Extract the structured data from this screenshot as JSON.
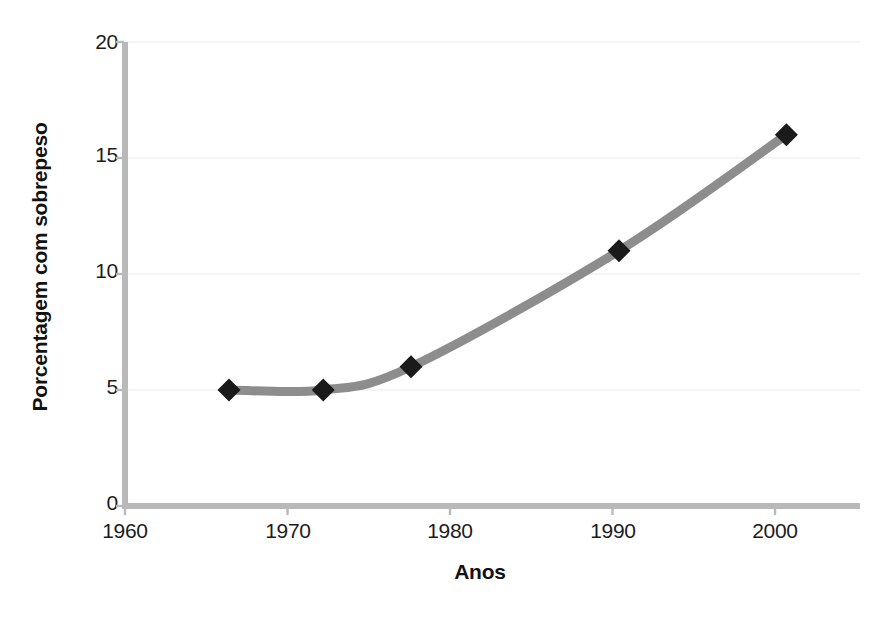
{
  "chart_data": {
    "type": "line",
    "title": "",
    "xlabel": "Anos",
    "ylabel": "Porcentagem com sobrepeso",
    "xlim": [
      1960,
      2004
    ],
    "ylim": [
      0,
      20
    ],
    "xticks": [
      1960,
      1970,
      1980,
      1990,
      2000
    ],
    "xtick_labels": [
      "1960",
      "1970",
      "1980",
      "1990",
      "2000"
    ],
    "yticks": [
      0,
      5,
      10,
      15,
      20
    ],
    "ytick_labels": [
      "0",
      "5",
      "10",
      "15",
      "20"
    ],
    "grid": true,
    "grid_axis": "y",
    "legend": false,
    "marker": "diamond",
    "marker_color": "#1a1a1a",
    "line_color": "#8d8d8d",
    "line_width_px": 9,
    "axis_color": "#b9b9b9",
    "series": [
      {
        "name": "Porcentagem com sobrepeso",
        "x": [
          1966.4,
          1972.2,
          1977.6,
          1990.4,
          2000.7
        ],
        "values": [
          5,
          5,
          6,
          11,
          16
        ],
        "points": [
          {
            "x": 1966.4,
            "y": 5
          },
          {
            "x": 1972.2,
            "y": 5
          },
          {
            "x": 1977.6,
            "y": 6
          },
          {
            "x": 1990.4,
            "y": 11
          },
          {
            "x": 2000.7,
            "y": 16
          }
        ]
      }
    ]
  },
  "axes": {
    "y_title": "Porcentagem com sobrepeso",
    "x_title": "Anos",
    "y_labels": {
      "t20": "20",
      "t15": "15",
      "t10": "10",
      "t5": "5",
      "t0": "0"
    },
    "x_labels": {
      "t1960": "1960",
      "t1970": "1970",
      "t1980": "1980",
      "t1990": "1990",
      "t2000": "2000"
    }
  }
}
